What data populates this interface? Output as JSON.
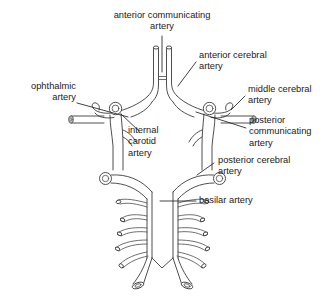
{
  "figure": {
    "background_color": "#ffffff",
    "line_color": "#3b3b3b",
    "text_color": "#1a1a1a"
  },
  "labels": {
    "anterior_communicating": "anterior communicating\nartery",
    "anterior_cerebral": "anterior cerebral\nartery",
    "ophthalmic": "ophthalmic\nartery",
    "middle_cerebral": "middle cerebral\nartery",
    "internal_carotid": "internal\ncarotid\nartery",
    "posterior_communicating": "posterior\ncommunicating\nartery",
    "posterior_cerebral": "posterior cerebral\nartery",
    "basilar": "basilar artery"
  },
  "structures": [
    {
      "name": "anterior-communicating-artery",
      "side": "midline"
    },
    {
      "name": "anterior-cerebral-artery",
      "side": "bilateral"
    },
    {
      "name": "ophthalmic-artery",
      "side": "bilateral"
    },
    {
      "name": "middle-cerebral-artery",
      "side": "bilateral"
    },
    {
      "name": "internal-carotid-artery",
      "side": "bilateral"
    },
    {
      "name": "posterior-communicating-artery",
      "side": "bilateral"
    },
    {
      "name": "posterior-cerebral-artery",
      "side": "bilateral"
    },
    {
      "name": "basilar-artery",
      "side": "midline"
    },
    {
      "name": "vertebral-artery",
      "side": "bilateral"
    },
    {
      "name": "pontine-branches",
      "side": "bilateral"
    }
  ]
}
